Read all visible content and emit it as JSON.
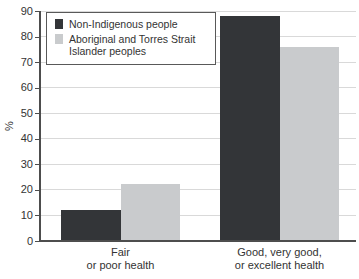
{
  "chart_data": {
    "type": "bar",
    "title": "",
    "ylabel": "%",
    "ylim": [
      0,
      90
    ],
    "ytick_step": 10,
    "yticks": [
      0,
      10,
      20,
      30,
      40,
      50,
      60,
      70,
      80,
      90
    ],
    "grid": true,
    "legend_position": "top-left",
    "categories": [
      {
        "slug": "fair-or-poor-health",
        "label": "Fair or poor health",
        "lines": [
          "Fair",
          "or poor health"
        ]
      },
      {
        "slug": "good-very-good-or-excellent-health",
        "label": "Good, very good, or excellent health",
        "lines": [
          "Good, very good,",
          "or excellent health"
        ]
      }
    ],
    "series": [
      {
        "name": "Non-Indigenous people",
        "slug": "non-indigenous",
        "color": "#333538",
        "values": [
          12,
          88
        ]
      },
      {
        "name": "Aboriginal and Torres Strait Islander peoples",
        "slug": "aboriginal-torres-strait-islander",
        "color": "#c9cbcd",
        "values": [
          22.5,
          76
        ]
      }
    ],
    "colors": {
      "gridline": "#d9d9d9",
      "axis": "#4d4d4d",
      "text": "#333333"
    }
  }
}
